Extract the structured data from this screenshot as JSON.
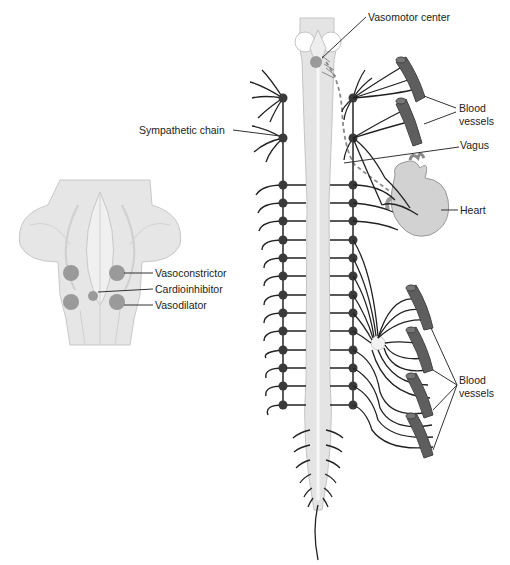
{
  "diagram": {
    "type": "anatomical-diagram",
    "colors": {
      "tissue": "#e6e6e6",
      "tissue_stroke": "#c4c4c4",
      "nucleus": "#9a9a9a",
      "nerve": "#222222",
      "ganglion": "#3a3a3a",
      "vessel": "#5e5e5e",
      "heart": "#cfcfcf",
      "vagus_dashed": "#8a8a8a"
    },
    "brainstem_inset": {
      "labels": {
        "vasoconstrictor": "Vasoconstrictor",
        "cardioinhibitor": "Cardioinhibitor",
        "vasodilator": "Vasodilator"
      }
    },
    "main": {
      "labels": {
        "vasomotor_center": "Vasomotor center",
        "blood_vessels_upper_1": "Blood",
        "blood_vessels_upper_2": "vessels",
        "vagus": "Vagus",
        "sympathetic_chain": "Sympathetic chain",
        "heart": "Heart",
        "blood_vessels_lower_1": "Blood",
        "blood_vessels_lower_2": "vessels"
      },
      "ganglia_rows": 13,
      "upper_ganglia": 2
    }
  }
}
